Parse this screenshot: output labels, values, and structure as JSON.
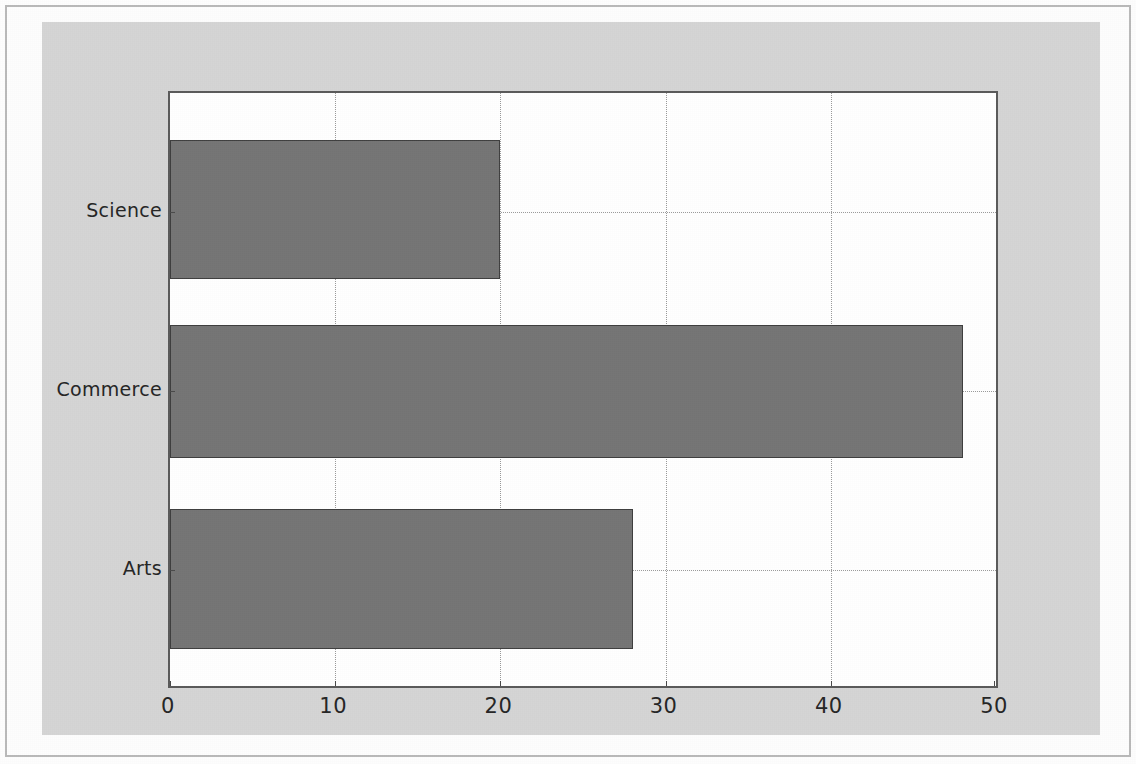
{
  "chart_data": {
    "type": "bar",
    "orientation": "horizontal",
    "title": "",
    "xlabel": "",
    "ylabel": "",
    "categories": [
      "Arts",
      "Commerce",
      "Science"
    ],
    "values": [
      28,
      48,
      20
    ],
    "series": [
      {
        "name": "",
        "values": [
          28,
          48,
          20
        ]
      }
    ],
    "xlim": [
      0,
      50
    ],
    "xticks": [
      0,
      10,
      20,
      30,
      40,
      50
    ],
    "xticklabels": [
      "0",
      "10",
      "20",
      "30",
      "40",
      "50"
    ],
    "yticklabels": [
      "Arts",
      "Commerce",
      "Science"
    ],
    "grid": true,
    "grid_style": "dotted",
    "legend": null,
    "bar_color": "#757575",
    "bar_edge_color": "#3f3f3f",
    "figure_background": "#d5d5d5",
    "axes_background": "#ffffff",
    "axis_color": "#5a5a5a"
  }
}
